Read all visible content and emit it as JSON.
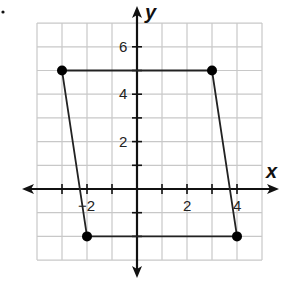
{
  "graph": {
    "x_axis_label": "x",
    "y_axis_label": "y",
    "x_tick_labels": [
      {
        "value": -2,
        "text": "−2"
      },
      {
        "value": 2,
        "text": "2"
      },
      {
        "value": 4,
        "text": "4"
      }
    ],
    "y_tick_labels": [
      {
        "value": 2,
        "text": "2"
      },
      {
        "value": 4,
        "text": "4"
      },
      {
        "value": 6,
        "text": "6"
      }
    ],
    "grid": {
      "x_min": -4,
      "x_max": 5,
      "y_min": -3,
      "y_max": 7
    },
    "shape": "parallelogram",
    "vertices": [
      {
        "x": -3,
        "y": 5
      },
      {
        "x": 3,
        "y": 5
      },
      {
        "x": 4,
        "y": -2
      },
      {
        "x": -2,
        "y": -2
      }
    ],
    "colors": {
      "grid": "#c8c8c8",
      "axis": "#111111",
      "shape": "#222222",
      "vertex": "#000000"
    }
  }
}
